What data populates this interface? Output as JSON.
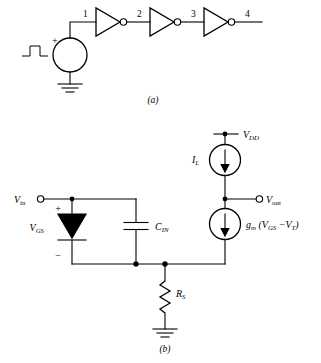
{
  "figure": {
    "title_a": "(a)",
    "title_b": "(b)",
    "panel_a": {
      "name": "inverter-chain",
      "node_labels": [
        "1",
        "2",
        "3",
        "4"
      ],
      "source": {
        "type": "pulse-voltage-source",
        "polarity_sign": "+",
        "waveform_icon": "pulse-icon",
        "ground_icon": "ground-icon"
      },
      "inverters": [
        {
          "index": 1,
          "symbol": "inverter-triangle-with-bubble"
        },
        {
          "index": 2,
          "symbol": "inverter-triangle-with-bubble"
        },
        {
          "index": 3,
          "symbol": "inverter-triangle-with-bubble"
        }
      ]
    },
    "panel_b": {
      "name": "small-signal-equivalent-circuit",
      "supply_label": "V",
      "supply_sub": "DD",
      "input_label": "V",
      "input_sub": "in",
      "output_label": "V",
      "output_sub": "out",
      "gate_source_label": "V",
      "gate_source_sub": "GS",
      "plus_sign": "+",
      "minus_sign": "−",
      "cap_label": "C",
      "cap_sub": "IN",
      "res_label": "R",
      "res_sub": "S",
      "load_current_label": "I",
      "load_current_sub": "L",
      "transconductance": {
        "gm_label": "g",
        "gm_sub": "m",
        "open_paren": "(",
        "v_label": "V",
        "v_sub": "GS",
        "minus": "−",
        "vt_label": "V",
        "vt_sub": "T",
        "close_paren": ")"
      },
      "components": [
        {
          "name": "diode",
          "symbol": "diode-icon"
        },
        {
          "name": "capacitor",
          "symbol": "capacitor-icon"
        },
        {
          "name": "resistor",
          "symbol": "resistor-zigzag-icon"
        },
        {
          "name": "current-source-load",
          "symbol": "current-source-circle-arrow-icon"
        },
        {
          "name": "current-source-gm",
          "symbol": "current-source-circle-arrow-icon"
        },
        {
          "name": "ground",
          "symbol": "ground-icon"
        }
      ]
    },
    "colors": {
      "ink": "#000000",
      "background": "#ffffff"
    }
  }
}
